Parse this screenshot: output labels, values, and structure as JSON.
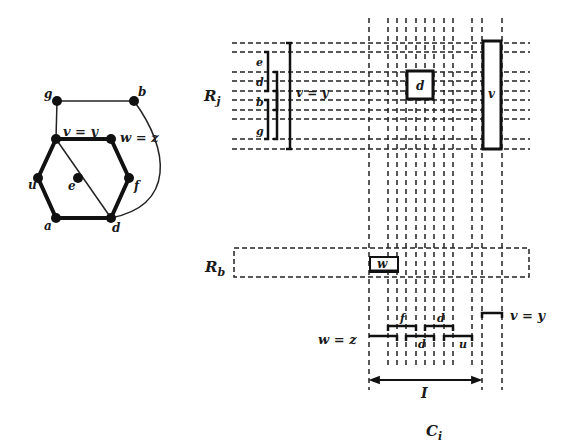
{
  "graph": {
    "nodes": [
      {
        "id": "g",
        "label": "g",
        "x": 57,
        "y": 101
      },
      {
        "id": "b",
        "label": "b",
        "x": 134,
        "y": 101
      },
      {
        "id": "v",
        "label": "v = y",
        "x": 56,
        "y": 139
      },
      {
        "id": "w",
        "label": "w = z",
        "x": 111,
        "y": 139
      },
      {
        "id": "u",
        "label": "u",
        "x": 38,
        "y": 178
      },
      {
        "id": "e",
        "label": "e",
        "x": 78,
        "y": 178
      },
      {
        "id": "f",
        "label": "f",
        "x": 129,
        "y": 178
      },
      {
        "id": "a",
        "label": "a",
        "x": 56,
        "y": 218
      },
      {
        "id": "d",
        "label": "d",
        "x": 111,
        "y": 218
      }
    ]
  },
  "grid": {
    "row_label_top": "R_j",
    "row_label_bottom": "R_b",
    "column_label": "C_i",
    "interval_label": "I",
    "bracket_labels": [
      "e",
      "d",
      "b",
      "g"
    ],
    "big_bracket_label": "v = y",
    "box_d_label": "d",
    "box_v_label": "v",
    "box_w_label": "w"
  },
  "intervals": {
    "left_label": "w = z",
    "right_label": "v = y",
    "labels": [
      "f",
      "d",
      "d",
      "u"
    ]
  }
}
